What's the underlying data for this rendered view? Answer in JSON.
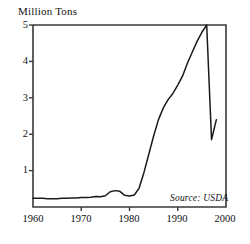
{
  "chart_data": {
    "type": "line",
    "title": "",
    "ylabel": "Million Tons",
    "xlabel": "",
    "xlim": [
      1960,
      2000
    ],
    "ylim": [
      0,
      5
    ],
    "grid": false,
    "legend": false,
    "yticks": [
      0,
      1,
      2,
      3,
      4,
      5
    ],
    "ytick_labels": [
      "",
      "1",
      "2",
      "3",
      "4",
      "5"
    ],
    "xticks": [
      1960,
      1970,
      1980,
      1990,
      2000
    ],
    "xtick_labels": [
      "1960",
      "1970",
      "1980",
      "1990",
      "2000"
    ],
    "annotation": "Source: USDA",
    "line_color": "#1a1a1a",
    "frame_color": "#3a3a3a",
    "series": [
      {
        "name": "Production",
        "x": [
          1960,
          1961,
          1962,
          1963,
          1964,
          1965,
          1966,
          1967,
          1968,
          1969,
          1970,
          1971,
          1972,
          1973,
          1974,
          1975,
          1976,
          1977,
          1978,
          1979,
          1980,
          1981,
          1982,
          1983,
          1984,
          1985,
          1986,
          1987,
          1988,
          1989,
          1990,
          1991,
          1992,
          1993,
          1994,
          1995,
          1996,
          1997,
          1998
        ],
        "values": [
          0.24,
          0.24,
          0.24,
          0.23,
          0.23,
          0.23,
          0.24,
          0.24,
          0.25,
          0.25,
          0.26,
          0.26,
          0.27,
          0.29,
          0.28,
          0.31,
          0.42,
          0.45,
          0.43,
          0.32,
          0.3,
          0.33,
          0.52,
          0.95,
          1.45,
          1.95,
          2.4,
          2.72,
          2.95,
          3.12,
          3.35,
          3.6,
          3.95,
          4.25,
          4.55,
          4.8,
          5.0,
          1.85,
          2.4
        ]
      }
    ]
  },
  "labels": {
    "y_axis_title": "Million Tons",
    "y_5": "5",
    "y_4": "4",
    "y_3": "3",
    "y_2": "2",
    "y_1": "1",
    "x_1960": "1960",
    "x_1970": "1970",
    "x_1980": "1980",
    "x_1990": "1990",
    "x_2000": "2000",
    "source": "Source: USDA"
  }
}
